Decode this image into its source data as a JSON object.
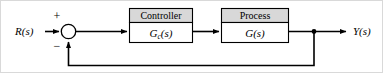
{
  "diagram": {
    "type": "block-diagram",
    "width": 383,
    "height": 73,
    "background_color": "#ffffff",
    "line_color": "#000000",
    "header_fill": "#d8d8d8",
    "body_fill": "#ffffff"
  },
  "signals": {
    "input_label": "R(s)",
    "output_label": "Y(s)"
  },
  "summing_junction": {
    "name": "summing-junction",
    "positive_sign": "+",
    "negative_sign": "−",
    "shape": "circle",
    "fill": "#ffffff"
  },
  "blocks": [
    {
      "id": "controller",
      "header": "Controller",
      "transfer_function_base": "G",
      "transfer_function_subscript": "c",
      "transfer_function_arg": "(s)",
      "transfer_function_full": "Gc(s)"
    },
    {
      "id": "process",
      "header": "Process",
      "transfer_function_base": "G",
      "transfer_function_subscript": "",
      "transfer_function_arg": "(s)",
      "transfer_function_full": "G(s)"
    }
  ],
  "feedback": {
    "name": "unity-feedback-path",
    "label": "",
    "has_block": false
  }
}
